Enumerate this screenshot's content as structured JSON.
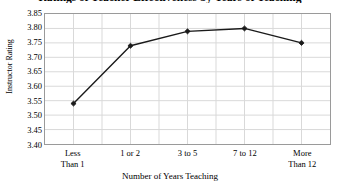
{
  "chart_data": {
    "type": "line",
    "title": "Ratings of Teacher Effectiveness by Years of Teaching",
    "xlabel": "Number of Years Teaching",
    "ylabel": "Instructor Rating",
    "categories": [
      "Less\nThan 1",
      "1 or 2",
      "3 to 5",
      "7 to 12",
      "More\nThan 12"
    ],
    "values": [
      3.54,
      3.74,
      3.79,
      3.8,
      3.75
    ],
    "ylim": [
      3.4,
      3.85
    ],
    "ytick_labels": [
      "3.85",
      "3.80",
      "3.75",
      "3.70",
      "3.65",
      "3.60",
      "3.55",
      "3.50",
      "3.45",
      "3.40"
    ],
    "ytick_values": [
      3.85,
      3.8,
      3.75,
      3.7,
      3.65,
      3.6,
      3.55,
      3.5,
      3.45,
      3.4
    ],
    "grid": true,
    "legend": false,
    "series_color": "#1a1a1a",
    "grid_color": "#d9d9d9",
    "border_color": "#9a9a9a",
    "marker": "diamond"
  }
}
